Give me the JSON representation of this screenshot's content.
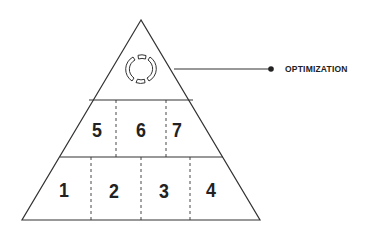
{
  "diagram": {
    "type": "pyramid",
    "apex": {
      "icon": "refresh-cycle-icon",
      "callout_label": "OPTIMIZATION"
    },
    "tiers": [
      {
        "name": "top",
        "segments": []
      },
      {
        "name": "middle",
        "segments": [
          "5",
          "6",
          "7"
        ]
      },
      {
        "name": "bottom",
        "segments": [
          "1",
          "2",
          "3",
          "4"
        ]
      }
    ],
    "colors": {
      "stroke": "#333333",
      "background": "#ffffff",
      "text": "#222222"
    }
  }
}
